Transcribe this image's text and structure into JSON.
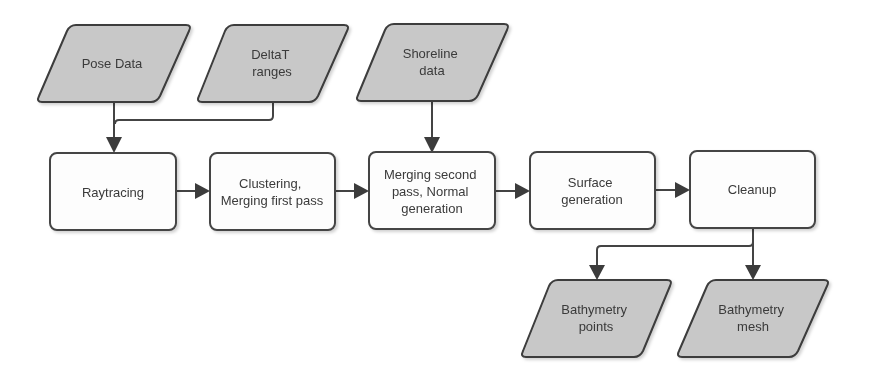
{
  "diagram": {
    "type": "flowchart",
    "colors": {
      "io_fill": "#c8c8c8",
      "process_fill": "#fdfdfd",
      "stroke": "#3c3c3c",
      "text": "#3a3a3a"
    },
    "inputs": [
      {
        "id": "pose",
        "lines": [
          "Pose Data"
        ]
      },
      {
        "id": "deltat",
        "lines": [
          "DeltaT",
          "ranges"
        ]
      },
      {
        "id": "shoreline",
        "lines": [
          "Shoreline",
          "data"
        ]
      }
    ],
    "processes": [
      {
        "id": "raytracing",
        "lines": [
          "Raytracing"
        ]
      },
      {
        "id": "clustering",
        "lines": [
          "Clustering,",
          "Merging first pass"
        ]
      },
      {
        "id": "merging2",
        "lines": [
          "Merging second",
          "pass, Normal",
          "generation"
        ]
      },
      {
        "id": "surface",
        "lines": [
          "Surface",
          "generation"
        ]
      },
      {
        "id": "cleanup",
        "lines": [
          "Cleanup"
        ]
      }
    ],
    "outputs": [
      {
        "id": "bathy_points",
        "lines": [
          "Bathymetry",
          "points"
        ]
      },
      {
        "id": "bathy_mesh",
        "lines": [
          "Bathymetry",
          "mesh"
        ]
      }
    ],
    "edges": [
      {
        "from": "pose",
        "to": "raytracing"
      },
      {
        "from": "deltat",
        "to": "raytracing"
      },
      {
        "from": "raytracing",
        "to": "clustering"
      },
      {
        "from": "clustering",
        "to": "merging2"
      },
      {
        "from": "shoreline",
        "to": "merging2"
      },
      {
        "from": "merging2",
        "to": "surface"
      },
      {
        "from": "surface",
        "to": "cleanup"
      },
      {
        "from": "cleanup",
        "to": "bathy_points"
      },
      {
        "from": "cleanup",
        "to": "bathy_mesh"
      }
    ]
  }
}
